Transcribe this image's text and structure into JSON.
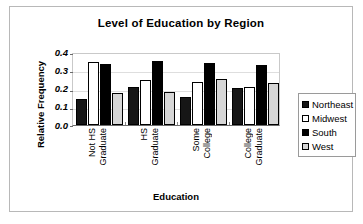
{
  "chart_data": {
    "type": "bar",
    "title": "Level of Education by Region",
    "xlabel": "Education",
    "ylabel": "Relative Frequency",
    "ylim": [
      0.0,
      0.4
    ],
    "yticks": [
      "0.0",
      "0.1",
      "0.2",
      "0.3",
      "0.4"
    ],
    "grid": true,
    "legend_position": "right",
    "categories": [
      "Not HS Graduate",
      "HS Graduate",
      "Some College",
      "College Graduate"
    ],
    "category_lines": [
      [
        "Not HS",
        "Graduate"
      ],
      [
        "HS",
        "Graduate"
      ],
      [
        "Some",
        "College"
      ],
      [
        "College",
        "Graduate"
      ]
    ],
    "series": [
      {
        "name": "Northeast",
        "color": "#161616",
        "values": [
          0.145,
          0.21,
          0.155,
          0.205
        ]
      },
      {
        "name": "Midwest",
        "color": "#ffffff",
        "values": [
          0.345,
          0.245,
          0.235,
          0.21
        ]
      },
      {
        "name": "South",
        "color": "#000000",
        "values": [
          0.335,
          0.35,
          0.34,
          0.33
        ]
      },
      {
        "name": "West",
        "color": "#d6d6d6",
        "values": [
          0.175,
          0.18,
          0.25,
          0.23
        ]
      }
    ]
  },
  "legend": {
    "items": [
      {
        "label": "Northeast",
        "key": "northeast"
      },
      {
        "label": "Midwest",
        "key": "midwest"
      },
      {
        "label": "South",
        "key": "south"
      },
      {
        "label": "West",
        "key": "west"
      }
    ]
  }
}
